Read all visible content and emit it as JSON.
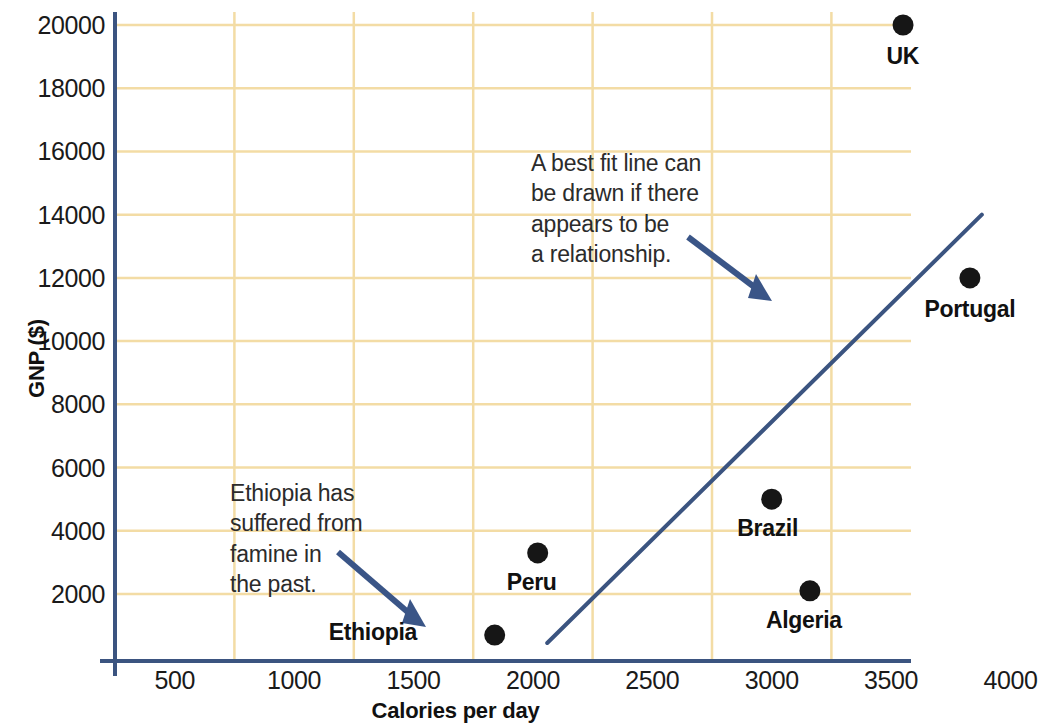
{
  "chart_data": {
    "type": "scatter",
    "title": "",
    "xlabel": "Calories per day",
    "ylabel": "GNP ($)",
    "xlim": [
      250,
      4100
    ],
    "ylim": [
      0,
      20300
    ],
    "xticks": [
      500,
      1000,
      1500,
      2000,
      2500,
      3000,
      3500,
      4000
    ],
    "yticks": [
      2000,
      4000,
      6000,
      8000,
      10000,
      12000,
      14000,
      16000,
      18000,
      20000
    ],
    "grid": true,
    "legend": "none",
    "points": [
      {
        "label": "UK",
        "x": 3550,
        "y": 20000
      },
      {
        "label": "Portugal",
        "x": 3830,
        "y": 12000
      },
      {
        "label": "Brazil",
        "x": 3000,
        "y": 5000
      },
      {
        "label": "Algeria",
        "x": 3160,
        "y": 2100
      },
      {
        "label": "Peru",
        "x": 2020,
        "y": 3300
      },
      {
        "label": "Ethiopia",
        "x": 1840,
        "y": 700
      }
    ],
    "trend_line": {
      "name": "best fit line",
      "x0": 2060,
      "y0": 450,
      "x1": 3880,
      "y1": 14000
    },
    "annotations": [
      {
        "id": "best-fit-note",
        "text": "A best fit line can\nbe drawn if there\nappears to be\na relationship."
      },
      {
        "id": "ethiopia-note",
        "text": "Ethiopia has\nsuffered from\nfamine in\nthe past."
      }
    ]
  },
  "colors": {
    "axis": "#3b5480",
    "grid": "#f3dca5",
    "point": "#161616",
    "trend": "#3b5480",
    "arrow": "#3a5587",
    "text": "#1a1a1a"
  },
  "axis_title_y": "GNP ($)",
  "axis_title_x": "Calories per day"
}
